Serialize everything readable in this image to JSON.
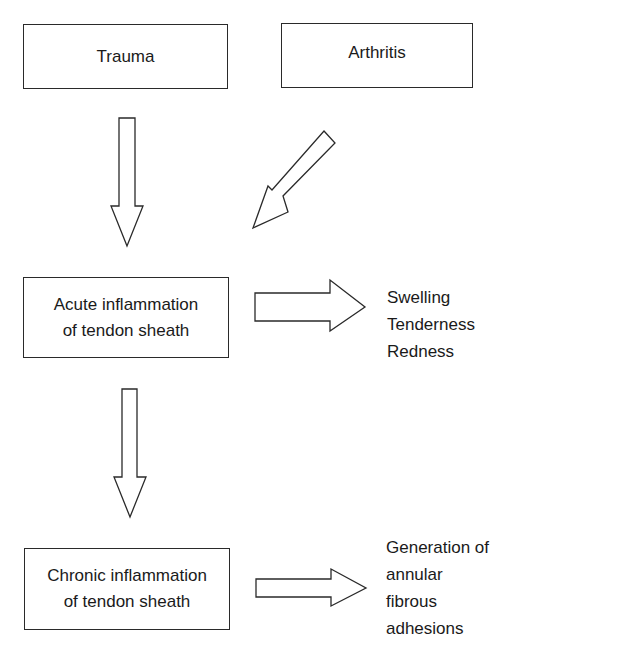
{
  "diagram": {
    "type": "flowchart",
    "nodes": {
      "trauma": {
        "label": "Trauma"
      },
      "arthritis": {
        "label": "Arthritis"
      },
      "acute": {
        "lines": [
          "Acute inflammation",
          "of tendon sheath"
        ]
      },
      "chronic": {
        "lines": [
          "Chronic inflammation",
          "of tendon sheath"
        ]
      }
    },
    "outcomes": {
      "acute_signs": [
        "Swelling",
        "Tenderness",
        "Redness"
      ],
      "chronic_result": [
        "Generation of",
        "annular",
        "fibrous",
        "adhesions"
      ]
    },
    "edges": [
      {
        "from": "Trauma",
        "to": "Acute inflammation of tendon sheath",
        "style": "hollow-block-arrow"
      },
      {
        "from": "Arthritis",
        "to": "Acute inflammation of tendon sheath",
        "style": "hollow-block-arrow"
      },
      {
        "from": "Acute inflammation of tendon sheath",
        "to": "Swelling / Tenderness / Redness",
        "style": "hollow-block-arrow"
      },
      {
        "from": "Acute inflammation of tendon sheath",
        "to": "Chronic inflammation of tendon sheath",
        "style": "hollow-block-arrow"
      },
      {
        "from": "Chronic inflammation of tendon sheath",
        "to": "Generation of annular fibrous adhesions",
        "style": "hollow-block-arrow"
      }
    ]
  }
}
